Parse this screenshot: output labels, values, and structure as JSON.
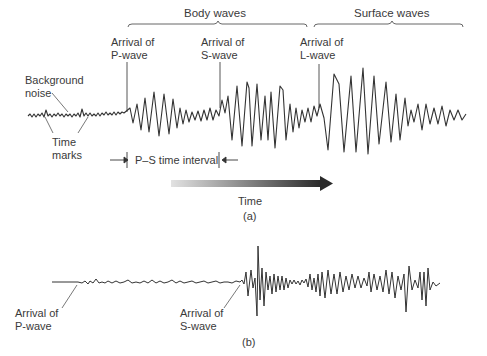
{
  "panel_a": {
    "caption": "(a)",
    "brackets": {
      "body_waves": "Body waves",
      "surface_waves": "Surface waves"
    },
    "labels": {
      "p_arrival": "Arrival of\nP-wave",
      "s_arrival": "Arrival of\nS-wave",
      "l_arrival": "Arrival of\nL-wave",
      "background_noise": "Background\nnoise",
      "time_marks": "Time\nmarks",
      "ps_interval": "P–S time interval"
    },
    "time_arrow": "Time"
  },
  "panel_b": {
    "caption": "(b)",
    "labels": {
      "p_arrival": "Arrival of\nP-wave",
      "s_arrival": "Arrival of\nS-wave"
    }
  },
  "colors": {
    "trace": "#333333",
    "arrow_start": "#dddddd",
    "arrow_end": "#2a2a2a"
  }
}
